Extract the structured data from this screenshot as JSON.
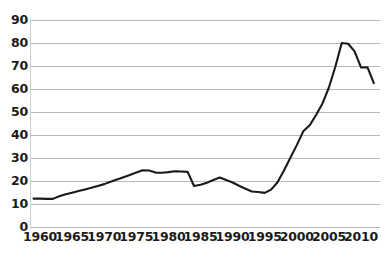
{
  "chart_data": {
    "type": "line",
    "title": "",
    "subtitle": "",
    "xlabel": "",
    "ylabel": "",
    "xlim": [
      1959,
      2012
    ],
    "ylim": [
      0,
      90
    ],
    "grid": true,
    "legend": null,
    "legend_position": "none",
    "y_ticks": [
      90,
      80,
      70,
      60,
      50,
      40,
      30,
      20,
      10,
      0
    ],
    "x_ticks": [
      1960,
      1965,
      1970,
      1975,
      1980,
      1985,
      1990,
      1995,
      2000,
      2005,
      2010
    ],
    "line_color": "#1a1a1a",
    "line_width": 2.1,
    "series": [
      {
        "name": "series-1",
        "x": [
          1959,
          1960,
          1961,
          1962,
          1963,
          1964,
          1965,
          1966,
          1967,
          1968,
          1969,
          1970,
          1971,
          1972,
          1973,
          1974,
          1975,
          1976,
          1977,
          1978,
          1979,
          1980,
          1981,
          1982,
          1983,
          1984,
          1985,
          1986,
          1987,
          1988,
          1989,
          1990,
          1991,
          1992,
          1993,
          1994,
          1995,
          1996,
          1997,
          1998,
          1999,
          2000,
          2001,
          2002,
          2003,
          2004,
          2005,
          2006,
          2007,
          2008,
          2009,
          2010,
          2011,
          2012
        ],
        "values": [
          12.3,
          12.3,
          12.2,
          12.2,
          13.3,
          14.2,
          14.9,
          15.6,
          16.3,
          17.0,
          17.8,
          18.6,
          19.6,
          20.6,
          21.6,
          22.6,
          23.6,
          24.6,
          24.5,
          23.6,
          23.5,
          23.8,
          24.2,
          24.1,
          23.9,
          17.8,
          18.3,
          19.2,
          20.4,
          21.5,
          20.4,
          19.3,
          17.9,
          16.6,
          15.4,
          15.2,
          14.8,
          16.2,
          19.4,
          24.5,
          30.0,
          35.5,
          41.5,
          44.1,
          48.6,
          53.6,
          60.5,
          69.5,
          79.8,
          79.5,
          76.2,
          69.2,
          69.3,
          62.4
        ]
      }
    ]
  }
}
